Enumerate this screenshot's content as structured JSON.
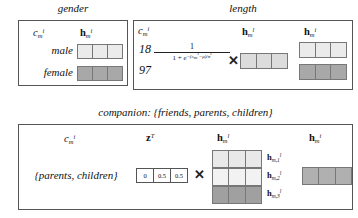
{
  "figure": {
    "panels": [
      {
        "id": "gender",
        "title": "gender",
        "headers": {
          "c": "c",
          "c_sub": "m",
          "c_sup": "i",
          "h": "h",
          "h_sub": "m",
          "h_sup": "i"
        },
        "rows": [
          {
            "label": "male",
            "color": "#ebebeb"
          },
          {
            "label": "female",
            "color": "#a8a8a8"
          }
        ]
      },
      {
        "id": "length",
        "title": "length",
        "headers": {
          "c": "c",
          "c_sub": "m",
          "c_sup": "i",
          "hl": "h",
          "hl_sub": "m",
          "hl_sup": "l",
          "hi": "h",
          "hi_sub": "m",
          "hi_sup": "i"
        },
        "values": [
          "18",
          "97"
        ],
        "formula": {
          "numerator": "1",
          "denominator_prefix": "1 + e",
          "denominator_exponent": "−(c",
          "exp_sub": "m",
          "exp_sup": "i",
          "exp_tail": "−μ)/σ",
          "exp_tail_sup": "i",
          "operator": "✕"
        },
        "hl_color": "#dcdcdc",
        "hi_rows": [
          {
            "color": "#ebebeb"
          },
          {
            "color": "#a8a8a8"
          }
        ]
      },
      {
        "id": "companion",
        "title": "companion: {friends, parents, children}",
        "headers": {
          "c": "c",
          "c_sub": "m",
          "c_sup": "i",
          "z": "z",
          "z_sup": "T",
          "hl": "h",
          "hl_sub": "m",
          "hl_sup": "l",
          "hi": "h",
          "hi_sub": "m",
          "hi_sup": "i"
        },
        "row_label": "{parents, children}",
        "z_values": [
          "0",
          "0.5",
          "0.5"
        ],
        "operator": "✕",
        "hl_rows": [
          {
            "color": "#e9e9e9",
            "label_sub": "m,1",
            "label_sup": "l"
          },
          {
            "color": "#f2f2f2",
            "label_sub": "m,2",
            "label_sup": "l"
          },
          {
            "color": "#a0a0a0",
            "label_sub": "m,3",
            "label_sup": "l"
          }
        ],
        "hi_color": "#b0b0b0"
      }
    ]
  }
}
